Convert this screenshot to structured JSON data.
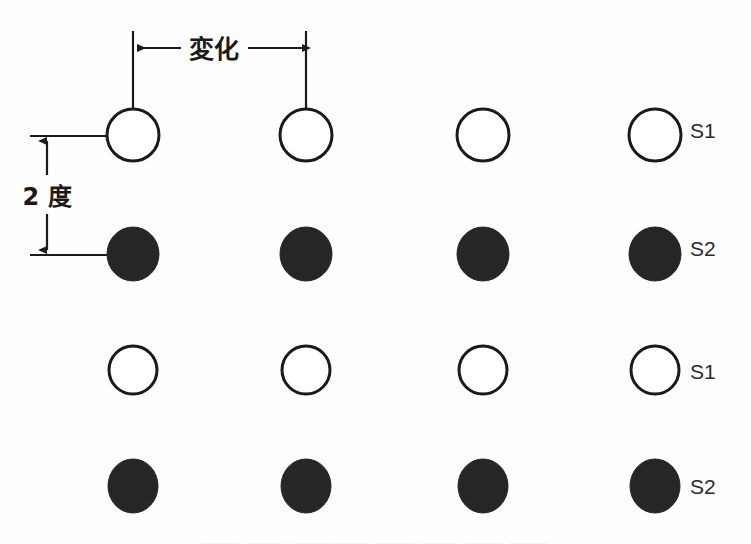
{
  "figure": {
    "title_hidden": "",
    "background_color": "#fefefe",
    "ink_color": "#1a1a1a",
    "open_marker_color": "#ffffff",
    "filled_marker_color": "#262626",
    "width": 751,
    "height": 544
  },
  "annotations": {
    "horizontal_dimension": {
      "label": "変化",
      "meaning_note": "",
      "left_x": 133,
      "right_x": 306,
      "arrow_y": 48,
      "extension_top_y": 31,
      "extension_bottom_y": 108,
      "label_font_size": 25
    },
    "vertical_dimension": {
      "label": "2 度",
      "top_y": 136,
      "bottom_y": 255,
      "arrow_x": 47,
      "tick_left_x": 30,
      "tick_right_x": 110,
      "label_font_size": 24
    }
  },
  "row_labels": [
    {
      "text": "S1",
      "x": 690,
      "y": 138,
      "font_size": 21
    },
    {
      "text": "S2",
      "x": 690,
      "y": 256,
      "font_size": 21
    },
    {
      "text": "S1",
      "x": 690,
      "y": 379,
      "font_size": 21
    },
    {
      "text": "S2",
      "x": 690,
      "y": 494,
      "font_size": 21
    }
  ],
  "chart_data": {
    "type": "scatter",
    "title": "",
    "xlabel": "",
    "ylabel": "",
    "grid": false,
    "legend": "none",
    "description_keys": [
      "変化",
      "2 度",
      "S1",
      "S2"
    ],
    "columns_x": [
      133,
      306,
      483,
      655
    ],
    "rows": [
      {
        "label": "S1",
        "marker": "open",
        "center_y": 135,
        "radius_x": 26,
        "radius_y": 26
      },
      {
        "label": "S2",
        "marker": "filled",
        "center_y": 254,
        "radius_x": 26,
        "radius_y": 27
      },
      {
        "label": "S1",
        "marker": "open",
        "center_y": 370,
        "radius_x": 24,
        "radius_y": 24
      },
      {
        "label": "S2",
        "marker": "filled",
        "center_y": 486,
        "radius_x": 25,
        "radius_y": 27
      }
    ],
    "points": [
      {
        "row": 0,
        "col": 0,
        "x": 133,
        "y": 135,
        "marker": "open"
      },
      {
        "row": 0,
        "col": 1,
        "x": 306,
        "y": 135,
        "marker": "open"
      },
      {
        "row": 0,
        "col": 2,
        "x": 483,
        "y": 135,
        "marker": "open"
      },
      {
        "row": 0,
        "col": 3,
        "x": 655,
        "y": 135,
        "marker": "open"
      },
      {
        "row": 1,
        "col": 0,
        "x": 133,
        "y": 254,
        "marker": "filled"
      },
      {
        "row": 1,
        "col": 1,
        "x": 306,
        "y": 254,
        "marker": "filled"
      },
      {
        "row": 1,
        "col": 2,
        "x": 483,
        "y": 254,
        "marker": "filled"
      },
      {
        "row": 1,
        "col": 3,
        "x": 655,
        "y": 254,
        "marker": "filled"
      },
      {
        "row": 2,
        "col": 0,
        "x": 133,
        "y": 370,
        "marker": "open"
      },
      {
        "row": 2,
        "col": 1,
        "x": 306,
        "y": 370,
        "marker": "open"
      },
      {
        "row": 2,
        "col": 2,
        "x": 483,
        "y": 370,
        "marker": "open"
      },
      {
        "row": 2,
        "col": 3,
        "x": 655,
        "y": 370,
        "marker": "open"
      },
      {
        "row": 3,
        "col": 0,
        "x": 133,
        "y": 486,
        "marker": "filled"
      },
      {
        "row": 3,
        "col": 1,
        "x": 306,
        "y": 486,
        "marker": "filled"
      },
      {
        "row": 3,
        "col": 2,
        "x": 483,
        "y": 486,
        "marker": "filled"
      },
      {
        "row": 3,
        "col": 3,
        "x": 655,
        "y": 486,
        "marker": "filled"
      }
    ]
  },
  "caption": {
    "cropped_text": "⸻ ⸻ ⸻⸻ ⸻ ⸻ ⸻ ⸻"
  }
}
